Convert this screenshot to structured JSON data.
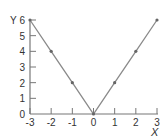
{
  "chart_data": {
    "type": "line",
    "title": "",
    "xlabel": "X",
    "ylabel": "Y",
    "x": [
      -3,
      -2,
      -1,
      0,
      1,
      2,
      3
    ],
    "series": [
      {
        "name": "y = 2|x|",
        "values": [
          6,
          4,
          2,
          0,
          2,
          4,
          6
        ]
      }
    ],
    "xlim": [
      -3,
      3
    ],
    "ylim": [
      0,
      6
    ],
    "xticks": [
      "-3",
      "-2",
      "-1",
      "0",
      "1",
      "2",
      "3"
    ],
    "yticks": [
      "0",
      "1",
      "2",
      "3",
      "4",
      "5",
      "6"
    ],
    "grid": false,
    "legend": "none",
    "line_color": "#8a8a8a",
    "axis_color": "#777777"
  }
}
